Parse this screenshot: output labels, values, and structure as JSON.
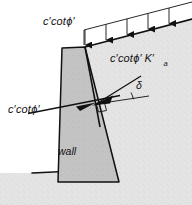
{
  "figure": {
    "type": "engineering-diagram",
    "background_color": "#ffffff",
    "line_color": "#111111",
    "soil_fill_color": "#e3e3e3",
    "wall_fill_color": "#c2c2c2",
    "labels": {
      "surcharge_top": {
        "c_prime": "c",
        "prime1": "′",
        "cot": "cot",
        "phi": "ϕ",
        "prime2": "′"
      },
      "backface_pressure": {
        "c_prime": "c",
        "prime1": "′",
        "cot": "cot",
        "phi": "ϕ",
        "prime2": "′",
        "k": "K",
        "prime3": "′",
        "subscript": "a"
      },
      "base_traction": {
        "c_prime": "c",
        "prime1": "′",
        "cot": "cot",
        "phi": "ϕ",
        "prime2": "′"
      },
      "wall": "wall",
      "delta": "δ"
    },
    "elements": {
      "surcharge_arrow_count": 5,
      "right_angle_marker": true,
      "ground_surface_slope": "down-to-left",
      "wall_shape": "tapered-trapezoid"
    }
  }
}
